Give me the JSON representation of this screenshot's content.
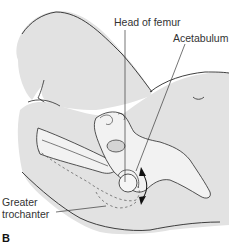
{
  "figure": {
    "panel_label": "B",
    "labels": {
      "head_of_femur": "Head of femur",
      "acetabulum": "Acetabulum",
      "greater_trochanter_line1": "Greater",
      "greater_trochanter_line2": "trochanter"
    },
    "colors": {
      "background": "#ffffff",
      "body_fill": "#e2e2e2",
      "bone_fill": "#efefef",
      "outline": "#2a2a2a",
      "leader_line": "#3a3a3a",
      "arrow": "#111111"
    }
  }
}
